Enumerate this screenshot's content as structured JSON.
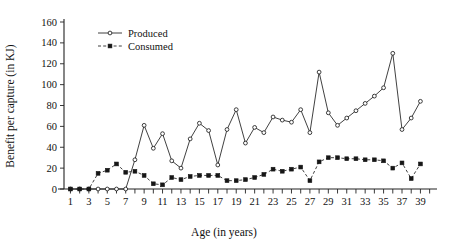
{
  "chart_data": {
    "type": "line",
    "title": "",
    "xlabel": "Age (in years)",
    "ylabel": "Benefit per capture (in KJ)",
    "xlim": [
      0.3,
      40.8
    ],
    "ylim": [
      0,
      160
    ],
    "ytick_values": [
      0,
      20,
      40,
      60,
      80,
      100,
      120,
      140,
      160
    ],
    "ytick_labels": [
      "0",
      "20",
      "40",
      "60",
      "80",
      "100",
      "120",
      "140",
      "160"
    ],
    "xtick_values": [
      1,
      2,
      3,
      4,
      5,
      6,
      7,
      8,
      9,
      10,
      11,
      12,
      13,
      14,
      15,
      16,
      17,
      18,
      19,
      20,
      21,
      22,
      23,
      24,
      25,
      26,
      27,
      28,
      29,
      30,
      31,
      32,
      33,
      34,
      35,
      36,
      37,
      38,
      39,
      40
    ],
    "xtick_labels_shown": [
      "1",
      "3",
      "5",
      "7",
      "9",
      "11",
      "13",
      "15",
      "17",
      "19",
      "21",
      "23",
      "25",
      "27",
      "29",
      "31",
      "33",
      "35",
      "37",
      "39"
    ],
    "xtick_labels_shown_values": [
      1,
      3,
      5,
      7,
      9,
      11,
      13,
      15,
      17,
      19,
      21,
      23,
      25,
      27,
      29,
      31,
      33,
      35,
      37,
      39
    ],
    "grid": false,
    "legend_position": "top-left-inside",
    "x": [
      1,
      2,
      3,
      4,
      5,
      6,
      7,
      8,
      9,
      10,
      11,
      12,
      13,
      14,
      15,
      16,
      17,
      18,
      19,
      20,
      21,
      22,
      23,
      24,
      25,
      26,
      27,
      28,
      29,
      30,
      31,
      32,
      33,
      34,
      35,
      36,
      37,
      38,
      39,
      40
    ],
    "series": [
      {
        "name": "Produced",
        "marker": "open-circle",
        "linestyle": "solid",
        "color": "#2b2b2b",
        "values": [
          0,
          0,
          0,
          0,
          0,
          0,
          0,
          28,
          61,
          39,
          53,
          27,
          20,
          48,
          63,
          56,
          23,
          57,
          76,
          44,
          59,
          54,
          69,
          66,
          64,
          76,
          54,
          112,
          73,
          61,
          68,
          75,
          82,
          89,
          97,
          130,
          57,
          68,
          84,
          null
        ]
      },
      {
        "name": "Consumed",
        "marker": "filled-square",
        "linestyle": "dashed",
        "color": "#2b2b2b",
        "values": [
          0,
          0,
          0,
          15,
          18,
          24,
          16,
          17,
          13,
          5,
          4,
          11,
          9,
          12,
          13,
          13,
          13,
          8,
          8,
          9,
          11,
          14,
          19,
          17,
          19,
          21,
          8,
          26,
          30,
          30,
          29,
          29,
          28,
          28,
          27,
          20,
          25,
          10,
          24,
          null
        ]
      }
    ],
    "series_x_override": {
      "Produced": [
        1,
        2,
        3,
        4,
        5,
        6,
        7,
        8,
        9,
        10,
        11,
        12,
        13,
        14,
        15,
        16,
        17,
        18,
        19,
        20,
        21,
        22,
        23,
        24,
        25,
        26,
        27,
        28,
        29,
        30,
        31,
        32,
        33,
        34,
        35,
        36,
        37,
        38,
        39
      ],
      "Consumed": [
        1,
        2,
        3,
        4,
        5,
        6,
        7,
        8,
        9,
        10,
        11,
        12,
        13,
        14,
        15,
        16,
        17,
        18,
        19,
        20,
        21,
        22,
        23,
        24,
        25,
        26,
        27,
        28,
        29,
        30,
        31,
        32,
        33,
        34,
        35,
        36,
        37,
        38,
        39
      ]
    }
  },
  "legend": {
    "produced_label": "Produced",
    "consumed_label": "Consumed"
  },
  "axes": {
    "x_title": "Age (in years)",
    "y_title": "Benefit per capture (in KJ)"
  }
}
